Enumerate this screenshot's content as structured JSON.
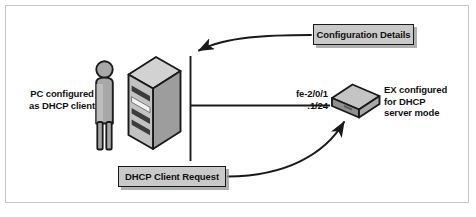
{
  "figure": {
    "background": "#ffffff",
    "border_color": "#c8c8c8"
  },
  "labels": {
    "pc": "PC configured\nas DHCP client",
    "ex": "EX configured\nfor DHCP\nserver mode",
    "interface": "fe-2/0/1",
    "address": ".1/24"
  },
  "callouts": {
    "configuration_details": "Configuration Details",
    "dhcp_client_request": "DHCP Client Request"
  },
  "nodes": [
    {
      "name": "person",
      "label": "PC configured as DHCP client"
    },
    {
      "name": "server-tower",
      "label": "DHCP client host"
    },
    {
      "name": "ex-switch",
      "label": "EX configured for DHCP server mode"
    }
  ],
  "colors": {
    "callout_fill": "#c9c9c9",
    "callout_border": "#1a1a1a",
    "device_light": "#d2d2d2",
    "device_mid": "#a8a8a8",
    "device_dark": "#7d7d7d",
    "outline": "#1a1a1a",
    "line": "#1a1a1a",
    "text": "#111111"
  }
}
